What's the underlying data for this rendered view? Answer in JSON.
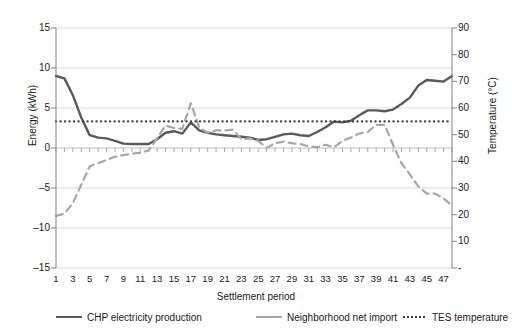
{
  "chart_data": {
    "type": "line",
    "title": "",
    "xlabel": "Settlement period",
    "ylabel": "Energy (kWh)",
    "ylabel_secondary": "Temperature (°C)",
    "grid": true,
    "legend_position": "bottom",
    "xlim": [
      1,
      48
    ],
    "ylim": [
      -15,
      15
    ],
    "ylim_secondary": [
      0,
      90
    ],
    "yticks": [
      15,
      10,
      5,
      0,
      -5,
      -10,
      -15
    ],
    "ytick_labels": [
      "15",
      "10",
      "5",
      "0",
      "–5",
      "–10",
      "–15"
    ],
    "yticks_secondary": [
      90,
      80,
      70,
      60,
      50,
      40,
      30,
      20,
      10,
      0
    ],
    "ytick_labels_secondary": [
      "90",
      "80",
      "70",
      "60",
      "50",
      "40",
      "30",
      "20",
      "10",
      "-"
    ],
    "x": [
      1,
      2,
      3,
      4,
      5,
      6,
      7,
      8,
      9,
      10,
      11,
      12,
      13,
      14,
      15,
      16,
      17,
      18,
      19,
      20,
      21,
      22,
      23,
      24,
      25,
      26,
      27,
      28,
      29,
      30,
      31,
      32,
      33,
      34,
      35,
      36,
      37,
      38,
      39,
      40,
      41,
      42,
      43,
      44,
      45,
      46,
      47,
      48
    ],
    "xtick_labels": [
      "1",
      "3",
      "5",
      "7",
      "9",
      "11",
      "13",
      "15",
      "17",
      "19",
      "21",
      "23",
      "25",
      "27",
      "29",
      "31",
      "33",
      "35",
      "37",
      "39",
      "41",
      "43",
      "45",
      "47"
    ],
    "series": [
      {
        "name": "CHP electricity production",
        "axis": "left",
        "style": "solid",
        "color": "#595959",
        "values": [
          9.0,
          8.7,
          6.6,
          3.8,
          1.6,
          1.3,
          1.2,
          0.9,
          0.55,
          0.5,
          0.5,
          0.5,
          1.1,
          1.9,
          2.1,
          1.8,
          3.2,
          2.2,
          1.9,
          1.7,
          1.6,
          1.5,
          1.4,
          1.3,
          1.0,
          1.1,
          1.4,
          1.7,
          1.8,
          1.6,
          1.5,
          2.0,
          2.6,
          3.3,
          3.2,
          3.4,
          4.1,
          4.7,
          4.7,
          4.6,
          4.8,
          5.5,
          6.3,
          7.8,
          8.5,
          8.4,
          8.3,
          9.0
        ]
      },
      {
        "name": "Neighborhood net import",
        "axis": "left",
        "style": "dashed",
        "color": "#a6a6a6",
        "values": [
          -8.5,
          -8.2,
          -6.9,
          -4.6,
          -2.3,
          -1.9,
          -1.5,
          -1.1,
          -0.9,
          -0.7,
          -0.6,
          -0.3,
          1.2,
          2.8,
          2.5,
          2.4,
          5.6,
          2.6,
          1.9,
          2.2,
          2.2,
          2.3,
          1.1,
          1.2,
          0.9,
          0.0,
          0.6,
          0.8,
          0.6,
          0.5,
          0.2,
          0.1,
          0.4,
          0.1,
          0.9,
          1.3,
          1.8,
          2.0,
          2.9,
          2.9,
          0.4,
          -1.9,
          -3.3,
          -4.8,
          -5.7,
          -5.7,
          -6.3,
          -7.2
        ]
      },
      {
        "name": "TES temperature",
        "axis": "right",
        "style": "dotted",
        "color": "#404040",
        "values": [
          55,
          55,
          55,
          55,
          55,
          55,
          55,
          55,
          55,
          55,
          55,
          55,
          55,
          55,
          55,
          55,
          55,
          55,
          55,
          55,
          55,
          55,
          55,
          55,
          55,
          55,
          55,
          55,
          55,
          55,
          55,
          55,
          55,
          55,
          55,
          55,
          55,
          55,
          55,
          55,
          55,
          55,
          55,
          55,
          55,
          55,
          55,
          55
        ]
      }
    ],
    "legend": [
      {
        "label": "CHP electricity production",
        "style": "solid",
        "color": "#595959"
      },
      {
        "label": "Neighborhood net import",
        "style": "dashed",
        "color": "#a6a6a6"
      },
      {
        "label": "TES temperature",
        "style": "dotted",
        "color": "#404040"
      }
    ]
  }
}
